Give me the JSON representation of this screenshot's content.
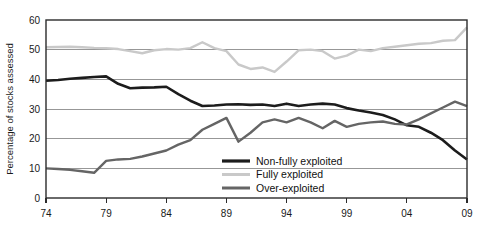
{
  "chart_data": {
    "type": "line",
    "title": "",
    "xlabel": "",
    "ylabel": "Percentage of stocks assessed",
    "xlim": [
      1974,
      2009
    ],
    "ylim": [
      0,
      60
    ],
    "grid": true,
    "legend_position": "inside-center-right",
    "x": [
      1974,
      1975,
      1976,
      1977,
      1978,
      1979,
      1980,
      1981,
      1982,
      1983,
      1984,
      1985,
      1986,
      1987,
      1988,
      1989,
      1990,
      1991,
      1992,
      1993,
      1994,
      1995,
      1996,
      1997,
      1998,
      1999,
      2000,
      2001,
      2002,
      2003,
      2004,
      2005,
      2006,
      2007,
      2008,
      2009
    ],
    "xticks": [
      1974,
      1979,
      1984,
      1989,
      1994,
      1999,
      2004,
      2009
    ],
    "xticklabels": [
      "74",
      "79",
      "84",
      "89",
      "94",
      "99",
      "04",
      "09"
    ],
    "yticks": [
      0,
      10,
      20,
      30,
      40,
      50,
      60
    ],
    "yticklabels": [
      "0",
      "10",
      "20",
      "30",
      "40",
      "50",
      "60"
    ],
    "series": [
      {
        "name": "Non-fully exploited",
        "color": "#1c1c1c",
        "width": 2.6,
        "values": [
          39.5,
          39.8,
          40.2,
          40.5,
          40.8,
          41.0,
          38.5,
          37.0,
          37.2,
          37.3,
          37.5,
          35.0,
          32.8,
          31.0,
          31.2,
          31.5,
          31.6,
          31.4,
          31.5,
          31.0,
          31.8,
          31.0,
          31.5,
          31.8,
          31.5,
          30.3,
          29.5,
          28.8,
          28.0,
          26.5,
          24.5,
          24.0,
          22.0,
          19.5,
          16.0,
          13.0
        ]
      },
      {
        "name": "Fully exploited",
        "color": "#c9c9c9",
        "width": 2.4,
        "values": [
          50.8,
          50.9,
          51.0,
          50.8,
          50.6,
          50.5,
          50.2,
          49.5,
          48.8,
          49.8,
          50.2,
          50.0,
          50.5,
          52.5,
          50.5,
          49.5,
          45.0,
          43.5,
          44.0,
          42.5,
          46.0,
          49.8,
          50.0,
          49.5,
          47.0,
          48.0,
          50.0,
          49.5,
          50.5,
          51.0,
          51.5,
          52.0,
          52.2,
          53.0,
          53.2,
          57.5
        ]
      },
      {
        "name": "Over-exploited",
        "color": "#656565",
        "width": 2.4,
        "values": [
          10.0,
          9.8,
          9.5,
          9.0,
          8.5,
          12.5,
          13.0,
          13.2,
          14.0,
          15.0,
          16.0,
          18.0,
          19.5,
          23.0,
          25.0,
          27.0,
          19.0,
          22.0,
          25.5,
          26.5,
          25.5,
          27.0,
          25.5,
          23.5,
          26.0,
          24.0,
          25.0,
          25.5,
          25.8,
          25.0,
          24.8,
          26.5,
          28.5,
          30.5,
          32.5,
          31.0
        ]
      }
    ]
  },
  "legend": {
    "entries": [
      {
        "label": "Non-fully exploited"
      },
      {
        "label": "Fully exploited"
      },
      {
        "label": "Over-exploited"
      }
    ]
  }
}
